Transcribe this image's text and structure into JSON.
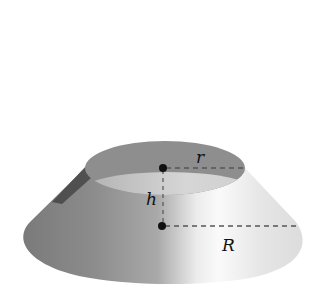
{
  "diagram": {
    "type": "frustum-of-cone",
    "labels": {
      "top_radius": "r",
      "bottom_radius": "R",
      "height": "h"
    },
    "colors": {
      "background": "#ffffff",
      "top_face": "#8e8e8e",
      "top_face_inner": "#bdbdbd",
      "body_dark": "#6a6a6a",
      "body_mid": "#9c9c9c",
      "body_light": "#f4f4f4",
      "dash": "#555555",
      "dot": "#111111"
    }
  }
}
